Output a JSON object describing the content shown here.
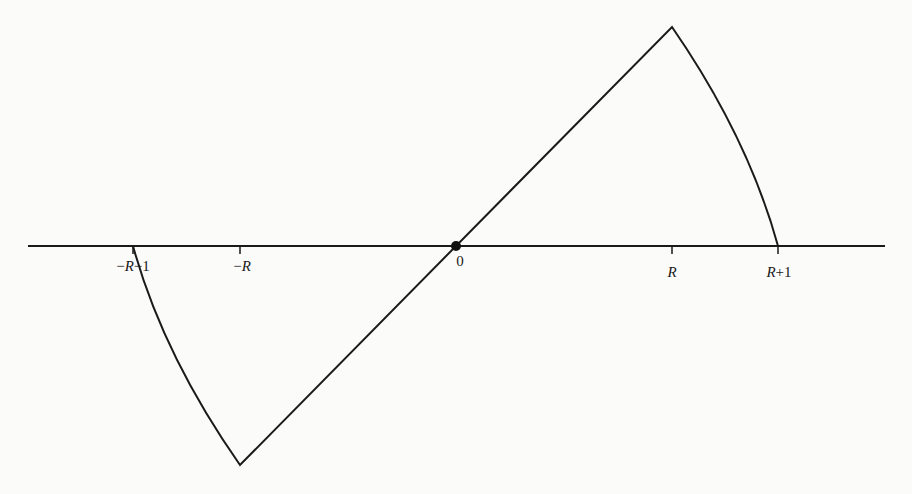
{
  "figure": {
    "axis": {
      "x_start": 28,
      "x_end": 885,
      "y": 246,
      "color": "#1a1a1a"
    },
    "origin_dot": {
      "x": 456,
      "y": 246,
      "r": 5
    },
    "ticks": [
      {
        "id": "neg-r-minus-1",
        "x": 133,
        "label_prefix": "−",
        "label_var": "R",
        "label_suffix": "−1",
        "label_x": 133,
        "label_y": 258
      },
      {
        "id": "neg-r",
        "x": 240,
        "label_prefix": "−",
        "label_var": "R",
        "label_suffix": "",
        "label_x": 242,
        "label_y": 258
      },
      {
        "id": "zero",
        "x": 456,
        "label_prefix": "",
        "label_var": "",
        "label_suffix": "0",
        "label_x": 460,
        "label_y": 253
      },
      {
        "id": "r",
        "x": 672,
        "label_prefix": "",
        "label_var": "R",
        "label_suffix": "",
        "label_x": 672,
        "label_y": 264
      },
      {
        "id": "r-plus-1",
        "x": 778,
        "label_prefix": "",
        "label_var": "R",
        "label_suffix": "+1",
        "label_x": 779,
        "label_y": 264
      }
    ],
    "curve": {
      "trough": {
        "x": 240,
        "y": 465
      },
      "peak": {
        "x": 672,
        "y": 27
      },
      "left_zero": {
        "x": 133,
        "y": 246
      },
      "right_zero": {
        "x": 778,
        "y": 246
      },
      "stroke": "#1a1a1a",
      "stroke_width": 2
    }
  }
}
